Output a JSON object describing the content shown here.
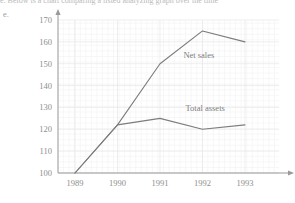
{
  "page": {
    "top_fragment": "e. Below is a chart comparing a listed analyzing graph over the time",
    "corner_fragment": "e."
  },
  "chart_data": {
    "type": "line",
    "title": "",
    "xlabel": "",
    "ylabel": "",
    "categories": [
      "1989",
      "1990",
      "1991",
      "1992",
      "1993"
    ],
    "x": [
      1989,
      1990,
      1991,
      1992,
      1993
    ],
    "ylim": [
      100,
      170
    ],
    "xlim": [
      1988.6,
      1993.8
    ],
    "yticks": [
      100,
      110,
      120,
      130,
      140,
      150,
      160,
      170
    ],
    "ytick_labels": [
      "100",
      "110",
      "120",
      "130",
      "140",
      "150",
      "160",
      "170"
    ],
    "xtick_labels": [
      "1989",
      "1990",
      "1991",
      "1992",
      "1993"
    ],
    "grid": true,
    "grid_style": "fine-square-faint",
    "legend": "inline-annotations",
    "line_color": "#7c7c7c",
    "axis_color": "#9a9a9a",
    "grid_color": "#eeeef1",
    "series": [
      {
        "name": "Net sales",
        "values": [
          100,
          122,
          150,
          165,
          160
        ],
        "label_x": 1991.55,
        "label_y": 152.5
      },
      {
        "name": "Total assets",
        "values": [
          100,
          122,
          125,
          120,
          122
        ],
        "label_x": 1991.6,
        "label_y": 128.5
      }
    ]
  }
}
